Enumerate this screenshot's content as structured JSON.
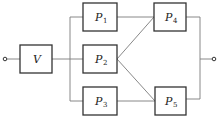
{
  "diagram": {
    "type": "reliability-block-diagram",
    "blocks": [
      {
        "id": "V",
        "label": "V",
        "subscript": ""
      },
      {
        "id": "P1",
        "label": "P",
        "subscript": "1"
      },
      {
        "id": "P2",
        "label": "P",
        "subscript": "2"
      },
      {
        "id": "P3",
        "label": "P",
        "subscript": "3"
      },
      {
        "id": "P4",
        "label": "P",
        "subscript": "4"
      },
      {
        "id": "P5",
        "label": "P",
        "subscript": "5"
      }
    ],
    "connections": [
      [
        "input",
        "V"
      ],
      [
        "V",
        "P1"
      ],
      [
        "V",
        "P2"
      ],
      [
        "V",
        "P3"
      ],
      [
        "P1",
        "P4"
      ],
      [
        "P2",
        "P4"
      ],
      [
        "P2",
        "P5"
      ],
      [
        "P3",
        "P5"
      ],
      [
        "P4",
        "output"
      ],
      [
        "P5",
        "output"
      ]
    ],
    "terminals": [
      "input",
      "output"
    ]
  }
}
